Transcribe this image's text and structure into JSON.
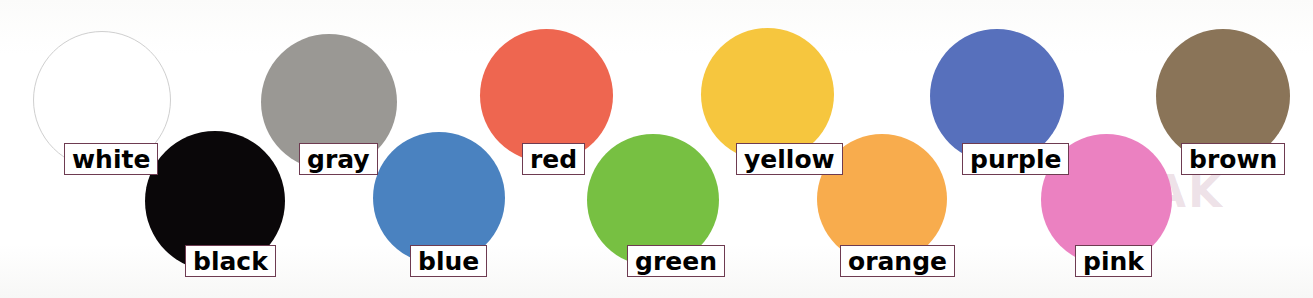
{
  "poster": {
    "title": "Color circles reference chart",
    "background_color": "#fdfdfc",
    "width": 1313,
    "height": 298,
    "label_border_color": "#6e3b51",
    "label_text_color": "#000000",
    "label_background_color": "#ffffff",
    "watermark_text": "SPEAK"
  },
  "chart_data": {
    "type": "scatter",
    "xlabel": "",
    "ylabel": "",
    "categories": [
      "white",
      "black",
      "gray",
      "blue",
      "red",
      "green",
      "yellow",
      "orange",
      "purple",
      "pink",
      "brown"
    ],
    "values": [
      "#ffffff",
      "#0a0709",
      "#9a9894",
      "#4a82c0",
      "#ee6650",
      "#77c042",
      "#f6c63e",
      "#f8ac4d",
      "#5770bc",
      "#eb81c1",
      "#8a7458"
    ]
  },
  "swatches": [
    {
      "name": "white",
      "label": "white",
      "fill": "#ffffff",
      "stroke": "#cfcfcf",
      "stroke_width": 1.4,
      "row": "top",
      "circle": {
        "x": 33,
        "y": 31,
        "size": 138
      },
      "label_box": {
        "x": 64,
        "y": 143,
        "w": 69,
        "h": 32
      }
    },
    {
      "name": "black",
      "label": "black",
      "fill": "#0a0709",
      "stroke": "none",
      "stroke_width": 0,
      "row": "bottom",
      "circle": {
        "x": 145,
        "y": 131,
        "size": 140
      },
      "label_box": {
        "x": 185,
        "y": 245,
        "w": 86,
        "h": 32
      }
    },
    {
      "name": "gray",
      "label": "gray",
      "fill": "#9a9894",
      "stroke": "none",
      "stroke_width": 0,
      "row": "top",
      "circle": {
        "x": 261,
        "y": 34,
        "size": 136
      },
      "label_box": {
        "x": 299,
        "y": 143,
        "w": 64,
        "h": 32
      }
    },
    {
      "name": "blue",
      "label": "blue",
      "fill": "#4a82c0",
      "stroke": "none",
      "stroke_width": 0,
      "row": "bottom",
      "circle": {
        "x": 373,
        "y": 132,
        "size": 132
      },
      "label_box": {
        "x": 410,
        "y": 245,
        "w": 64,
        "h": 32
      }
    },
    {
      "name": "red",
      "label": "red",
      "fill": "#ee6650",
      "stroke": "none",
      "stroke_width": 0,
      "row": "top",
      "circle": {
        "x": 480,
        "y": 29,
        "size": 133
      },
      "label_box": {
        "x": 522,
        "y": 143,
        "w": 55,
        "h": 32
      }
    },
    {
      "name": "green",
      "label": "green",
      "fill": "#77c042",
      "stroke": "none",
      "stroke_width": 0,
      "row": "bottom",
      "circle": {
        "x": 587,
        "y": 134,
        "size": 132
      },
      "label_box": {
        "x": 627,
        "y": 245,
        "w": 82,
        "h": 32
      }
    },
    {
      "name": "yellow",
      "label": "yellow",
      "fill": "#f6c63e",
      "stroke": "none",
      "stroke_width": 0,
      "row": "top",
      "circle": {
        "x": 701,
        "y": 28,
        "size": 133
      },
      "label_box": {
        "x": 736,
        "y": 143,
        "w": 88,
        "h": 32
      }
    },
    {
      "name": "orange",
      "label": "orange",
      "fill": "#f8ac4d",
      "stroke": "none",
      "stroke_width": 0,
      "row": "bottom",
      "circle": {
        "x": 817,
        "y": 134,
        "size": 130
      },
      "label_box": {
        "x": 840,
        "y": 245,
        "w": 97,
        "h": 32
      }
    },
    {
      "name": "purple",
      "label": "purple",
      "fill": "#5770bc",
      "stroke": "none",
      "stroke_width": 0,
      "row": "top",
      "circle": {
        "x": 930,
        "y": 29,
        "size": 134
      },
      "label_box": {
        "x": 962,
        "y": 143,
        "w": 89,
        "h": 32
      }
    },
    {
      "name": "pink",
      "label": "pink",
      "fill": "#eb81c1",
      "stroke": "none",
      "stroke_width": 0,
      "row": "bottom",
      "circle": {
        "x": 1041,
        "y": 134,
        "size": 131
      },
      "label_box": {
        "x": 1075,
        "y": 245,
        "w": 64,
        "h": 32
      }
    },
    {
      "name": "brown",
      "label": "brown",
      "fill": "#8a7458",
      "stroke": "none",
      "stroke_width": 0,
      "row": "top",
      "circle": {
        "x": 1156,
        "y": 29,
        "size": 134
      },
      "label_box": {
        "x": 1181,
        "y": 143,
        "w": 89,
        "h": 32
      }
    }
  ]
}
